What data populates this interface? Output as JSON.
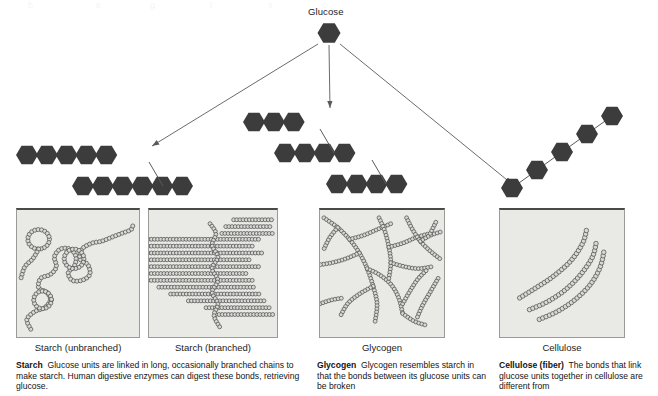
{
  "diagram": {
    "title_label": "Glucose",
    "colors": {
      "hexagon_fill": "#3c3c3c",
      "arrow_stroke": "#5a5a5a",
      "panel_background": "#e9e9e6",
      "panel_border": "#9a9a96",
      "panel_top_border": "#4a4a48",
      "bead_stroke": "#4f4f4f",
      "bead_fill": "#d8d8d4",
      "text": "#141414"
    },
    "source_hexagon": {
      "x": 329,
      "y": 33
    },
    "arrows": [
      {
        "name": "arrow-to-starch",
        "x1": 318,
        "y1": 44,
        "x2": 152,
        "y2": 146
      },
      {
        "name": "arrow-to-glycogen",
        "x1": 329,
        "y1": 45,
        "x2": 330,
        "y2": 108
      },
      {
        "name": "arrow-to-cellulose",
        "x1": 340,
        "y1": 44,
        "x2": 512,
        "y2": 184
      }
    ]
  },
  "chains": {
    "starch": {
      "name": "Starch",
      "rows": [
        {
          "count": 5,
          "x": 16,
          "y": 155
        },
        {
          "count": 6,
          "x": 72,
          "y": 186
        }
      ],
      "branch": {
        "x1": 149,
        "y1": 162,
        "x2": 163,
        "y2": 186
      }
    },
    "glycogen": {
      "name": "Glycogen",
      "rows": [
        {
          "count": 3,
          "x": 243,
          "y": 122
        },
        {
          "count": 4,
          "x": 274,
          "y": 153
        },
        {
          "count": 4,
          "x": 326,
          "y": 184
        }
      ],
      "branches": [
        {
          "x1": 320,
          "y1": 129,
          "x2": 334,
          "y2": 153
        },
        {
          "x1": 372,
          "y1": 160,
          "x2": 386,
          "y2": 184
        }
      ]
    },
    "cellulose": {
      "name": "Cellulose",
      "steps": [
        {
          "x": 512,
          "y": 188
        },
        {
          "x": 537,
          "y": 170
        },
        {
          "x": 562,
          "y": 152
        },
        {
          "x": 587,
          "y": 134
        },
        {
          "x": 612,
          "y": 116
        }
      ]
    }
  },
  "panels": [
    {
      "id": "starch-unbranched",
      "label": "Starch (unbranched)",
      "x": 16,
      "y": 208,
      "w": 124,
      "h": 130,
      "label_x": 16,
      "label_w": 124
    },
    {
      "id": "starch-branched",
      "label": "Starch (branched)",
      "x": 148,
      "y": 208,
      "w": 130,
      "h": 130,
      "label_x": 148,
      "label_w": 130
    },
    {
      "id": "glycogen",
      "label": "Glycogen",
      "x": 319,
      "y": 208,
      "w": 126,
      "h": 130,
      "label_x": 319,
      "label_w": 126
    },
    {
      "id": "cellulose",
      "label": "Cellulose",
      "x": 499,
      "y": 208,
      "w": 126,
      "h": 130,
      "label_x": 499,
      "label_w": 126
    }
  ],
  "captions": [
    {
      "id": "starch-caption",
      "lead": "Starch",
      "body": "Glucose units are linked in long, occasionally branched chains to make starch. Human digestive enzymes can digest these bonds, retrieving glucose.",
      "x": 16,
      "y": 360,
      "w": 288
    },
    {
      "id": "glycogen-caption",
      "lead": "Glycogen",
      "body": "Glycogen resembles starch in that the bonds between its glucose units can be broken",
      "x": 317,
      "y": 360,
      "w": 172
    },
    {
      "id": "cellulose-caption",
      "lead": "Cellulose (fiber)",
      "body": "The bonds that link glucose units together in cellulose are different from",
      "x": 499,
      "y": 360,
      "w": 158
    }
  ],
  "bleed_text": [
    {
      "text": "b",
      "x": 28
    },
    {
      "text": "e",
      "x": 96
    },
    {
      "text": "g",
      "x": 150
    },
    {
      "text": "t",
      "x": 210
    },
    {
      "text": "s",
      "x": 268
    },
    {
      "text": "o",
      "x": 322
    }
  ]
}
